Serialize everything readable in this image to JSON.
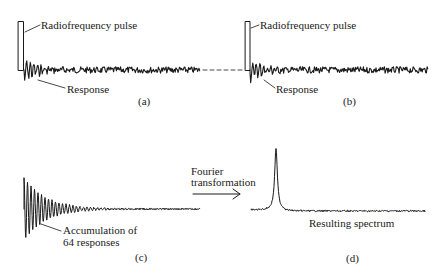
{
  "figure": {
    "panels": {
      "a": {
        "label": "(a)",
        "pulse_label": "Radiofrequency pulse",
        "response_label": "Response"
      },
      "b": {
        "label": "(b)",
        "pulse_label": "Radiofrequency pulse",
        "response_label": "Response"
      },
      "c": {
        "label": "(c)",
        "annotation_line1": "Accumulation of",
        "annotation_line2": "64 responses"
      },
      "d": {
        "label": "(d)",
        "annotation": "Resulting spectrum"
      }
    },
    "transform": {
      "line1": "Fourier",
      "line2": "transformation",
      "arrow": "right-arrow"
    },
    "colors": {
      "ink": "#1a1a1a",
      "background": "#ffffff"
    }
  }
}
